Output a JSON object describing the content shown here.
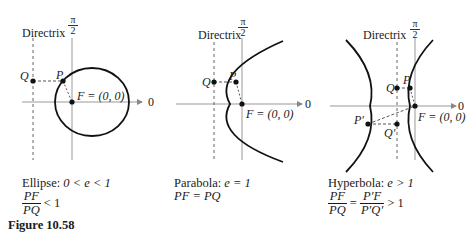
{
  "figure_title": "Figure 10.58",
  "common": {
    "directrix_label": "Directrix",
    "pi_num": "π",
    "pi_den": "2",
    "zero_label": "0",
    "focus_label": "F = (0, 0)"
  },
  "ellipse": {
    "caption_name": "Ellipse:",
    "caption_cond": "0 < e < 1",
    "ratio_num": "PF",
    "ratio_den": "PQ",
    "ratio_rel": "< 1",
    "point_P": "P",
    "point_Q": "Q"
  },
  "parabola": {
    "caption_name": "Parabola:",
    "caption_cond": "e = 1",
    "equation": "PF = PQ",
    "point_P": "P",
    "point_Q": "Q"
  },
  "hyperbola": {
    "caption_name": "Hyperbola:",
    "caption_cond": "e > 1",
    "ratio_num": "PF",
    "ratio_den": "PQ",
    "eq": "=",
    "ratio2_num": "P′F",
    "ratio2_den": "P′Q′",
    "ratio_rel": "> 1",
    "point_P": "P",
    "point_Q": "Q",
    "point_P2": "P′",
    "point_Q2": "Q′"
  }
}
